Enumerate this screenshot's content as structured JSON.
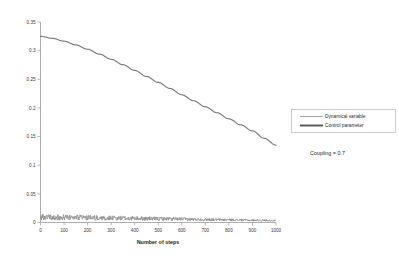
{
  "chart_data": {
    "type": "line",
    "title": "",
    "xlabel": "Number of steps",
    "ylabel": "",
    "xlim": [
      0,
      1000
    ],
    "ylim": [
      0,
      0.35
    ],
    "grid": false,
    "legend_position": "right",
    "xticks": [
      0,
      100,
      200,
      300,
      400,
      500,
      600,
      700,
      800,
      900,
      1000
    ],
    "xtick_labels": [
      "0",
      "100",
      "200",
      "300",
      "400",
      "500",
      "600",
      "700",
      "800",
      "900",
      "1000"
    ],
    "yticks": [
      0,
      0.05,
      0.1,
      0.15,
      0.2,
      0.25,
      0.3,
      0.35
    ],
    "ytick_labels": [
      "0",
      "0.05",
      "0.1",
      "0.15",
      "0.2",
      "0.25",
      "0.3",
      "0.35"
    ],
    "annotations": [
      "Coupling = 0.7"
    ],
    "series": [
      {
        "name": "Dynamical variable",
        "color": "#8c8c8c",
        "style": "oscillating-band",
        "x": [
          0,
          50,
          100,
          150,
          200,
          250,
          300,
          350,
          400,
          450,
          500,
          550,
          600,
          650,
          700,
          750,
          800,
          850,
          900,
          950,
          1000
        ],
        "values": [
          0.009,
          0.0088,
          0.0086,
          0.0083,
          0.008,
          0.0077,
          0.0074,
          0.0071,
          0.0068,
          0.0065,
          0.0062,
          0.0059,
          0.0056,
          0.0053,
          0.005,
          0.0047,
          0.0044,
          0.0041,
          0.0038,
          0.0035,
          0.0032
        ],
        "band_amplitude": [
          0.0055,
          0.0053,
          0.0051,
          0.0049,
          0.0047,
          0.0045,
          0.0043,
          0.0041,
          0.0039,
          0.0037,
          0.0035,
          0.0033,
          0.0031,
          0.0029,
          0.0027,
          0.0025,
          0.0023,
          0.0021,
          0.0019,
          0.0017,
          0.0015
        ]
      },
      {
        "name": "Control parameter",
        "color": "#7a7a7a",
        "style": "smooth-decay",
        "x": [
          0,
          50,
          100,
          150,
          200,
          250,
          300,
          350,
          400,
          450,
          500,
          550,
          600,
          650,
          700,
          750,
          800,
          850,
          900,
          950,
          1000
        ],
        "values": [
          0.325,
          0.3215,
          0.3165,
          0.31,
          0.3025,
          0.294,
          0.285,
          0.2755,
          0.2655,
          0.255,
          0.2445,
          0.234,
          0.223,
          0.2125,
          0.202,
          0.1915,
          0.181,
          0.1705,
          0.16,
          0.147,
          0.135
        ]
      }
    ]
  },
  "legend": {
    "items": [
      {
        "label": "Dynamical variable",
        "color": "#8c8c8c",
        "thickness": "thin"
      },
      {
        "label": "Control parameter",
        "color": "#555555",
        "thickness": "thick"
      }
    ]
  },
  "annotation": {
    "coupling_text": "Coupling = 0.7"
  },
  "axes": {
    "x_title": "Number of steps"
  }
}
